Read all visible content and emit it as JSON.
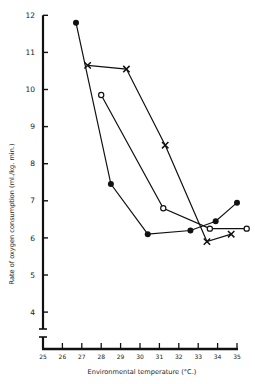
{
  "chart_data": {
    "type": "line",
    "title": "",
    "xlabel": "Environmental temperature (°C.)",
    "ylabel": "Rate of oxygen consumption (ml./kg. min.)",
    "xlim": [
      25,
      35
    ],
    "ylim": [
      4,
      12
    ],
    "x_ticks": [
      25,
      26,
      27,
      28,
      29,
      30,
      31,
      32,
      33,
      34,
      35
    ],
    "y_ticks": [
      4,
      5,
      6,
      7,
      8,
      9,
      10,
      11,
      12
    ],
    "grid": false,
    "legend": null,
    "y_axis_break": true,
    "series": [
      {
        "name": "filled-circle",
        "marker": "filled-circle",
        "points": [
          [
            26.7,
            11.8
          ],
          [
            28.5,
            7.45
          ],
          [
            30.4,
            6.1
          ],
          [
            32.6,
            6.2
          ],
          [
            33.9,
            6.45
          ],
          [
            35.0,
            6.95
          ]
        ]
      },
      {
        "name": "open-circle",
        "marker": "open-circle",
        "points": [
          [
            28.0,
            9.85
          ],
          [
            31.2,
            6.8
          ],
          [
            33.6,
            6.25
          ],
          [
            35.5,
            6.25
          ]
        ]
      },
      {
        "name": "cross",
        "marker": "cross",
        "points": [
          [
            27.3,
            10.65
          ],
          [
            29.3,
            10.55
          ],
          [
            31.3,
            8.5
          ],
          [
            33.45,
            5.9
          ],
          [
            34.7,
            6.1
          ]
        ]
      }
    ]
  },
  "colors": {
    "ink": "#111111",
    "background": "#ffffff"
  }
}
